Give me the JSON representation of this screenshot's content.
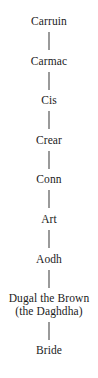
{
  "chart_data": {
    "type": "diagram",
    "title": "",
    "layout": "vertical-lineage",
    "orientation": "top-to-bottom",
    "connector_color": "#9a9a9a",
    "text_color": "#1b1b1b",
    "background": "#ffffff",
    "nodes": [
      {
        "id": "n1",
        "lines": [
          "Carruin"
        ]
      },
      {
        "id": "n2",
        "lines": [
          "Carmac"
        ]
      },
      {
        "id": "n3",
        "lines": [
          "Cis"
        ]
      },
      {
        "id": "n4",
        "lines": [
          "Crear"
        ]
      },
      {
        "id": "n5",
        "lines": [
          "Conn"
        ]
      },
      {
        "id": "n6",
        "lines": [
          "Art"
        ]
      },
      {
        "id": "n7",
        "lines": [
          "Aodh"
        ]
      },
      {
        "id": "n8",
        "lines": [
          "Dugal the Brown",
          "(the Daghdha)"
        ]
      },
      {
        "id": "n9",
        "lines": [
          "Bride"
        ]
      }
    ],
    "edges": [
      {
        "from": "n1",
        "to": "n2"
      },
      {
        "from": "n2",
        "to": "n3"
      },
      {
        "from": "n3",
        "to": "n4"
      },
      {
        "from": "n4",
        "to": "n5"
      },
      {
        "from": "n5",
        "to": "n6"
      },
      {
        "from": "n6",
        "to": "n7"
      },
      {
        "from": "n7",
        "to": "n8"
      },
      {
        "from": "n8",
        "to": "n9"
      }
    ]
  },
  "nodes": {
    "n1": {
      "line1": "Carruin"
    },
    "n2": {
      "line1": "Carmac"
    },
    "n3": {
      "line1": "Cis"
    },
    "n4": {
      "line1": "Crear"
    },
    "n5": {
      "line1": "Conn"
    },
    "n6": {
      "line1": "Art"
    },
    "n7": {
      "line1": "Aodh"
    },
    "n8": {
      "line1": "Dugal the Brown",
      "line2": "(the Daghdha)"
    },
    "n9": {
      "line1": "Bride"
    }
  }
}
